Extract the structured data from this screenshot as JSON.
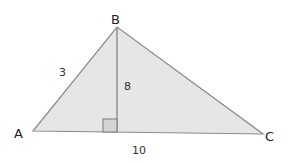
{
  "diagram": {
    "title": "",
    "type": "triangle",
    "colors": {
      "fill": "#e6e6e6",
      "stroke": "#8a8a8a",
      "altitude": "#8a8a8a",
      "right_angle_marker_fill": "#d4d4d4",
      "text": "#222222"
    },
    "vertices": {
      "A": {
        "label": "A",
        "x": 33,
        "y": 131
      },
      "B": {
        "label": "B",
        "x": 117,
        "y": 27
      },
      "C": {
        "label": "C",
        "x": 263,
        "y": 134
      }
    },
    "foot": {
      "x": 117,
      "y": 132
    },
    "right_angle_marker": {
      "x": 103,
      "y": 120,
      "size": 14
    },
    "labels": {
      "vertex_a": "A",
      "vertex_b": "B",
      "vertex_c": "C",
      "side_ab": "3",
      "altitude_bd": "8",
      "base_ac": "10"
    }
  }
}
